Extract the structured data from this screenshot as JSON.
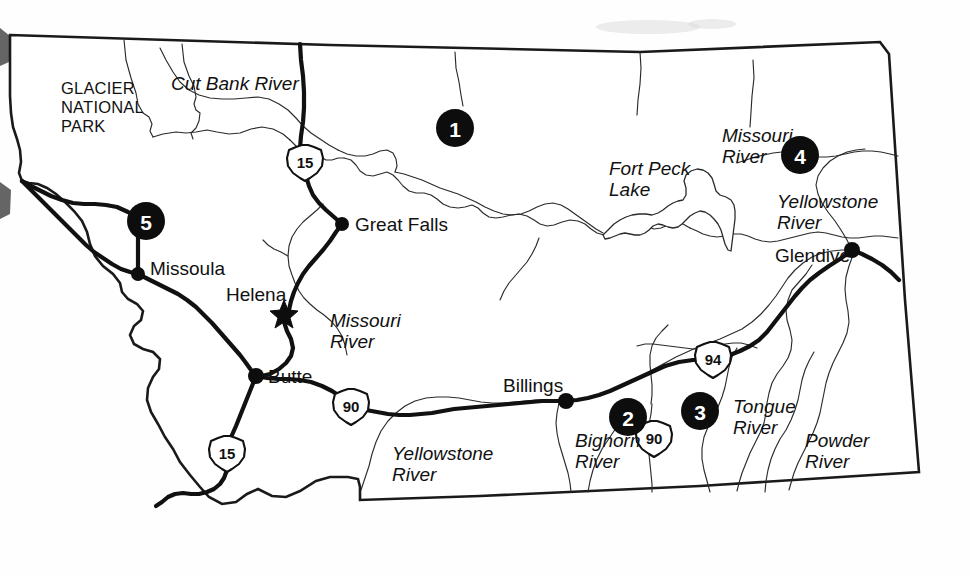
{
  "map": {
    "title": "Montana Reference Map",
    "state": "Montana",
    "background_color": "#ffffff",
    "ink_color": "#111111",
    "marker_fill": "#0d0d0d",
    "marker_text_color": "#ffffff"
  },
  "numbered_markers": [
    {
      "id": "marker-1",
      "number": "1",
      "cx": 455,
      "cy": 128,
      "r": 19
    },
    {
      "id": "marker-2",
      "number": "2",
      "cx": 628,
      "cy": 417,
      "r": 19
    },
    {
      "id": "marker-3",
      "number": "3",
      "cx": 700,
      "cy": 411,
      "r": 19
    },
    {
      "id": "marker-4",
      "number": "4",
      "cx": 800,
      "cy": 155,
      "r": 19
    },
    {
      "id": "marker-5",
      "number": "5",
      "cx": 146,
      "cy": 221,
      "r": 19
    }
  ],
  "cities": [
    {
      "id": "city-great-falls",
      "name": "Great Falls",
      "dot_x": 342,
      "dot_y": 224,
      "label_x": 355,
      "label_y": 231,
      "type": "city"
    },
    {
      "id": "city-missoula",
      "name": "Missoula",
      "dot_x": 138,
      "dot_y": 274,
      "label_x": 150,
      "label_y": 275,
      "type": "city"
    },
    {
      "id": "city-helena",
      "name": "Helena",
      "dot_x": 284,
      "dot_y": 313,
      "label_x": 226,
      "label_y": 301,
      "type": "capital"
    },
    {
      "id": "city-butte",
      "name": "Butte",
      "dot_x": 256,
      "dot_y": 376,
      "label_x": 268,
      "label_y": 383,
      "type": "city"
    },
    {
      "id": "city-billings",
      "name": "Billings",
      "dot_x": 566,
      "dot_y": 401,
      "label_x": 503,
      "label_y": 392,
      "type": "city"
    },
    {
      "id": "city-glendive",
      "name": "Glendive",
      "dot_x": 852,
      "dot_y": 250,
      "label_x": 775,
      "label_y": 262,
      "type": "city"
    }
  ],
  "river_labels": [
    {
      "id": "label-cut-bank-river",
      "text": "Cut Bank River",
      "x": 171,
      "y": 90,
      "lines": [
        "Cut Bank River"
      ]
    },
    {
      "id": "label-missouri-river-north",
      "text": "Missouri River",
      "x": 722,
      "y": 142,
      "lines": [
        "Missouri",
        "River"
      ]
    },
    {
      "id": "label-missouri-river-central",
      "text": "Missouri River",
      "x": 330,
      "y": 327,
      "lines": [
        "Missouri",
        "River"
      ]
    },
    {
      "id": "label-yellowstone-river-east",
      "text": "Yellowstone River",
      "x": 777,
      "y": 208,
      "lines": [
        "Yellowstone",
        "River"
      ]
    },
    {
      "id": "label-yellowstone-river-south",
      "text": "Yellowstone River",
      "x": 392,
      "y": 460,
      "lines": [
        "Yellowstone",
        "River"
      ]
    },
    {
      "id": "label-bighorn-river",
      "text": "Bighorn River",
      "x": 575,
      "y": 447,
      "lines": [
        "Bighorn",
        "River"
      ]
    },
    {
      "id": "label-tongue-river",
      "text": "Tongue River",
      "x": 733,
      "y": 413,
      "lines": [
        "Tongue",
        "River"
      ]
    },
    {
      "id": "label-powder-river",
      "text": "Powder River",
      "x": 805,
      "y": 447,
      "lines": [
        "Powder",
        "River"
      ]
    }
  ],
  "lake_labels": [
    {
      "id": "label-fort-peck-lake",
      "text": "Fort Peck Lake",
      "x": 609,
      "y": 175,
      "lines": [
        "Fort Peck",
        "Lake"
      ]
    }
  ],
  "park_labels": [
    {
      "id": "label-glacier-national-park",
      "text": "GLACIER NATIONAL PARK",
      "x": 61,
      "y": 94,
      "lines": [
        "GLACIER",
        "NATIONAL",
        "PARK"
      ]
    }
  ],
  "highway_shields": [
    {
      "id": "shield-i15-north",
      "route": "15",
      "cx": 305,
      "cy": 162,
      "type": "interstate"
    },
    {
      "id": "shield-i15-south",
      "route": "15",
      "cx": 227,
      "cy": 453,
      "type": "interstate"
    },
    {
      "id": "shield-i90-west",
      "route": "90",
      "cx": 351,
      "cy": 406,
      "type": "interstate"
    },
    {
      "id": "shield-i90-east",
      "route": "90",
      "cx": 654,
      "cy": 438,
      "type": "interstate"
    },
    {
      "id": "shield-i94",
      "route": "94",
      "cx": 713,
      "cy": 359,
      "type": "interstate"
    }
  ]
}
